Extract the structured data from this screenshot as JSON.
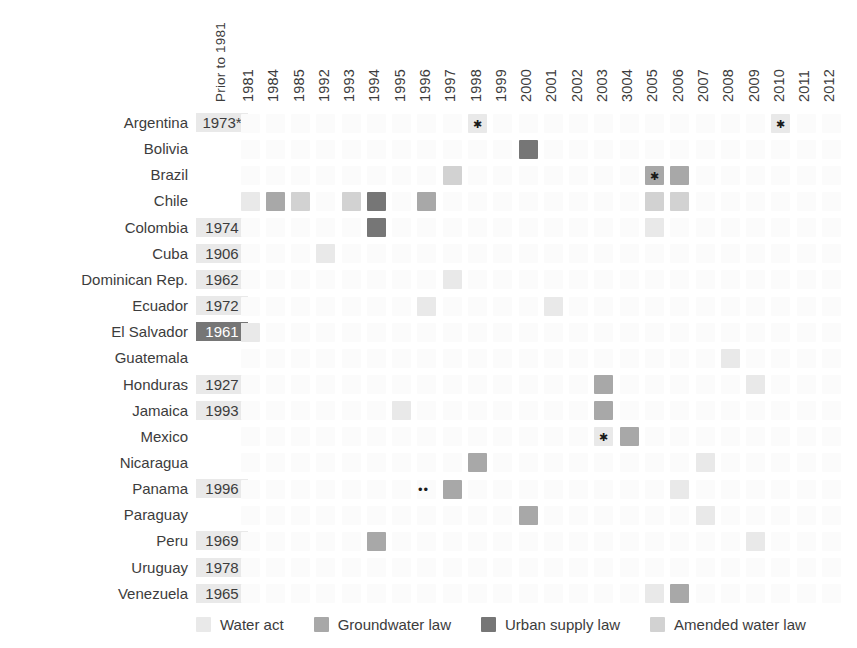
{
  "chart_data": {
    "type": "heatmap",
    "title": "",
    "xlabel": "",
    "ylabel": "",
    "grid": false,
    "legend_position": "bottom",
    "first_column_label": "Prior to 1981",
    "columns": [
      "1981",
      "1984",
      "1985",
      "1992",
      "1993",
      "1994",
      "1995",
      "1996",
      "1997",
      "1998",
      "1999",
      "2000",
      "2001",
      "2002",
      "2003",
      "3004",
      "2005",
      "2006",
      "2007",
      "2008",
      "2009",
      "2010",
      "2011",
      "2012"
    ],
    "categories": [
      "Argentina",
      "Bolivia",
      "Brazil",
      "Chile",
      "Colombia",
      "Cuba",
      "Dominican Rep.",
      "Ecuador",
      "El Salvador",
      "Guatemala",
      "Honduras",
      "Jamaica",
      "Mexico",
      "Nicaragua",
      "Panama",
      "Paraguay",
      "Peru",
      "Uruguay",
      "Venezuela"
    ],
    "prior_values": [
      {
        "country": "Argentina",
        "value": "1973*",
        "kind": "water-act"
      },
      {
        "country": "Bolivia",
        "value": "",
        "kind": "none"
      },
      {
        "country": "Brazil",
        "value": "",
        "kind": "none"
      },
      {
        "country": "Chile",
        "value": "",
        "kind": "none"
      },
      {
        "country": "Colombia",
        "value": "1974",
        "kind": "water-act"
      },
      {
        "country": "Cuba",
        "value": "1906",
        "kind": "water-act"
      },
      {
        "country": "Dominican Rep.",
        "value": "1962",
        "kind": "water-act"
      },
      {
        "country": "Ecuador",
        "value": "1972",
        "kind": "water-act"
      },
      {
        "country": "El Salvador",
        "value": "1961",
        "kind": "urban-supply-law"
      },
      {
        "country": "Guatemala",
        "value": "",
        "kind": "none"
      },
      {
        "country": "Honduras",
        "value": "1927",
        "kind": "water-act"
      },
      {
        "country": "Jamaica",
        "value": "1993",
        "kind": "water-act"
      },
      {
        "country": "Mexico",
        "value": "",
        "kind": "none"
      },
      {
        "country": "Nicaragua",
        "value": "",
        "kind": "none"
      },
      {
        "country": "Panama",
        "value": "1996",
        "kind": "water-act"
      },
      {
        "country": "Paraguay",
        "value": "",
        "kind": "none"
      },
      {
        "country": "Peru",
        "value": "1969",
        "kind": "water-act"
      },
      {
        "country": "Uruguay",
        "value": "1978",
        "kind": "water-act"
      },
      {
        "country": "Venezuela",
        "value": "1965",
        "kind": "water-act"
      }
    ],
    "marks": [
      {
        "country": "Argentina",
        "year": "1998",
        "kind": "water-act",
        "star": true
      },
      {
        "country": "Argentina",
        "year": "2010",
        "kind": "water-act",
        "star": true
      },
      {
        "country": "Bolivia",
        "year": "2000",
        "kind": "urban-supply-law",
        "star": false
      },
      {
        "country": "Brazil",
        "year": "1997",
        "kind": "amended-water-law",
        "star": false
      },
      {
        "country": "Brazil",
        "year": "2005",
        "kind": "groundwater-law",
        "star": true
      },
      {
        "country": "Brazil",
        "year": "2006",
        "kind": "groundwater-law",
        "star": false
      },
      {
        "country": "Chile",
        "year": "1981",
        "kind": "water-act",
        "star": false
      },
      {
        "country": "Chile",
        "year": "1984",
        "kind": "groundwater-law",
        "star": false
      },
      {
        "country": "Chile",
        "year": "1985",
        "kind": "amended-water-law",
        "star": false
      },
      {
        "country": "Chile",
        "year": "1993",
        "kind": "amended-water-law",
        "star": false
      },
      {
        "country": "Chile",
        "year": "1994",
        "kind": "urban-supply-law",
        "star": false
      },
      {
        "country": "Chile",
        "year": "1996",
        "kind": "groundwater-law",
        "star": false
      },
      {
        "country": "Chile",
        "year": "2005",
        "kind": "amended-water-law",
        "star": false
      },
      {
        "country": "Chile",
        "year": "2006",
        "kind": "amended-water-law",
        "star": false
      },
      {
        "country": "Colombia",
        "year": "1994",
        "kind": "urban-supply-law",
        "star": false
      },
      {
        "country": "Colombia",
        "year": "2005",
        "kind": "water-act",
        "star": false
      },
      {
        "country": "Cuba",
        "year": "1992",
        "kind": "water-act",
        "star": false
      },
      {
        "country": "Dominican Rep.",
        "year": "1997",
        "kind": "water-act",
        "star": false
      },
      {
        "country": "Ecuador",
        "year": "1996",
        "kind": "water-act",
        "star": false
      },
      {
        "country": "Ecuador",
        "year": "2001",
        "kind": "water-act",
        "star": false
      },
      {
        "country": "El Salvador",
        "year": "1981",
        "kind": "water-act",
        "star": false
      },
      {
        "country": "Guatemala",
        "year": "2008",
        "kind": "water-act",
        "star": false
      },
      {
        "country": "Honduras",
        "year": "2003",
        "kind": "groundwater-law",
        "star": false
      },
      {
        "country": "Honduras",
        "year": "2009",
        "kind": "water-act",
        "star": false
      },
      {
        "country": "Jamaica",
        "year": "1995",
        "kind": "water-act",
        "star": false
      },
      {
        "country": "Jamaica",
        "year": "2003",
        "kind": "groundwater-law",
        "star": false
      },
      {
        "country": "Mexico",
        "year": "2003",
        "kind": "water-act",
        "star": true
      },
      {
        "country": "Mexico",
        "year": "3004",
        "kind": "groundwater-law",
        "star": false
      },
      {
        "country": "Nicaragua",
        "year": "1998",
        "kind": "groundwater-law",
        "star": false
      },
      {
        "country": "Nicaragua",
        "year": "2007",
        "kind": "water-act",
        "star": false
      },
      {
        "country": "Panama",
        "year": "1996",
        "kind": "dots",
        "star": false
      },
      {
        "country": "Panama",
        "year": "1997",
        "kind": "groundwater-law",
        "star": false
      },
      {
        "country": "Panama",
        "year": "2006",
        "kind": "water-act",
        "star": false
      },
      {
        "country": "Paraguay",
        "year": "2000",
        "kind": "groundwater-law",
        "star": false
      },
      {
        "country": "Paraguay",
        "year": "2007",
        "kind": "water-act",
        "star": false
      },
      {
        "country": "Peru",
        "year": "1994",
        "kind": "groundwater-law",
        "star": false
      },
      {
        "country": "Peru",
        "year": "2009",
        "kind": "water-act",
        "star": false
      },
      {
        "country": "Venezuela",
        "year": "2005",
        "kind": "water-act",
        "star": false
      },
      {
        "country": "Venezuela",
        "year": "2006",
        "kind": "groundwater-law",
        "star": false
      }
    ],
    "legend": [
      {
        "label": "Water act",
        "kind": "water-act",
        "color": "#e9e9e9"
      },
      {
        "label": "Groundwater law",
        "kind": "groundwater-law",
        "color": "#a8a8a8"
      },
      {
        "label": "Urban supply law",
        "kind": "urban-supply-law",
        "color": "#767676"
      },
      {
        "label": "Amended water law",
        "kind": "amended-water-law",
        "color": "#d2d2d2"
      }
    ],
    "colors": {
      "water-act": "#e9e9e9",
      "groundwater-law": "#a8a8a8",
      "urban-supply-law": "#767676",
      "amended-water-law": "#d2d2d2",
      "background": "#ffffff",
      "text": "#3c3c3c",
      "star": "#1a1a1a"
    }
  }
}
